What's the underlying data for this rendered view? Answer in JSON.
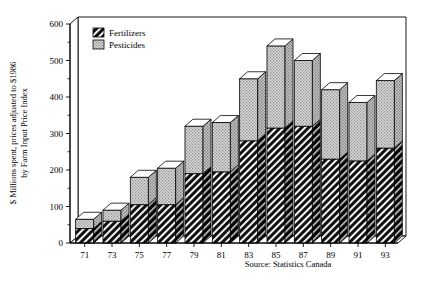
{
  "chart_data": {
    "type": "bar",
    "subtype": "stacked-3d-column",
    "title": "",
    "xlabel": "",
    "ylabel": "$ Millions spent, prices adjusted to $1986 by Farm Input Price Index",
    "ylabel_line1": "$ Millions spent, prices adjusted to $1986",
    "ylabel_line2": "by Farm Input Price Index",
    "categories": [
      "71",
      "73",
      "75",
      "77",
      "79",
      "81",
      "83",
      "85",
      "87",
      "89",
      "91",
      "93"
    ],
    "series": [
      {
        "name": "Fertilizers",
        "fill": "diagonal-hatch-dark",
        "color": "#1a1a1a",
        "values": [
          40,
          60,
          105,
          105,
          190,
          195,
          280,
          315,
          320,
          230,
          225,
          260
        ]
      },
      {
        "name": "Pesticides",
        "fill": "light-stipple",
        "color": "#d4d4d4",
        "values": [
          25,
          30,
          75,
          100,
          130,
          135,
          170,
          225,
          180,
          190,
          160,
          185
        ]
      }
    ],
    "totals": [
      65,
      90,
      180,
      205,
      320,
      330,
      450,
      540,
      500,
      420,
      385,
      445
    ],
    "ylim": [
      0,
      600
    ],
    "yticks": [
      0,
      100,
      200,
      300,
      400,
      500,
      600
    ],
    "yticks_minor": [
      50,
      150,
      250,
      350,
      450,
      550
    ],
    "ytick_labels": [
      "0",
      "100",
      "200",
      "300",
      "400",
      "500",
      "600"
    ],
    "grid": false,
    "legend_position": "top-left",
    "source_note": "Source: Statistics Canada"
  },
  "legend": {
    "items": [
      {
        "label": "Fertilizers",
        "swatch": "fertilizers-swatch"
      },
      {
        "label": "Pesticides",
        "swatch": "pesticides-swatch"
      }
    ]
  },
  "footer": {
    "source": "Source: Statistics Canada"
  }
}
